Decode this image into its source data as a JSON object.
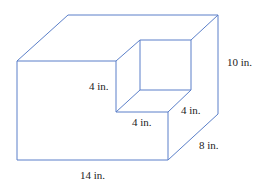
{
  "figure": {
    "type": "rectangular prism with cube-shaped notch removed from top-front-right corner",
    "stroke_color": "#5b7fc9",
    "labels": {
      "height": "10 in.",
      "notch_height": "4 in.",
      "notch_depth": "4 in.",
      "notch_width": "4 in.",
      "depth": "8 in.",
      "length": "14 in."
    }
  }
}
